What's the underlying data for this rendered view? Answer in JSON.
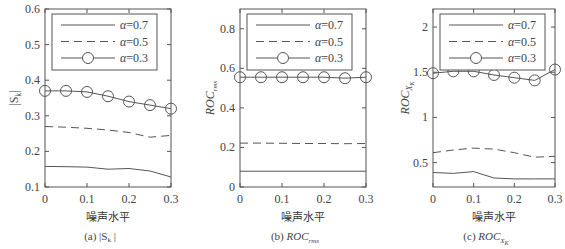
{
  "chart_data": [
    {
      "type": "line",
      "panel": "a",
      "caption": "(a) |S_k|",
      "caption_label": "(a)",
      "caption_symbol": "|S",
      "caption_sub": "k",
      "caption_end": "|",
      "xlabel": "噪声水平",
      "ylabel": "|S_k|",
      "x": [
        0,
        0.05,
        0.1,
        0.15,
        0.2,
        0.25,
        0.3
      ],
      "xticks": [
        "0",
        "0.1",
        "0.2",
        "0.3"
      ],
      "xlim": [
        0,
        0.3
      ],
      "ylim": [
        0.1,
        0.6
      ],
      "yticks": [
        "0.1",
        "0.2",
        "0.3",
        "0.4",
        "0.5",
        "0.6"
      ],
      "legend_position": "upper left",
      "series": [
        {
          "name": "α=0.7",
          "style": "solid",
          "values": [
            0.158,
            0.157,
            0.156,
            0.15,
            0.152,
            0.145,
            0.128
          ]
        },
        {
          "name": "α=0.5",
          "style": "dashed",
          "values": [
            0.27,
            0.268,
            0.265,
            0.26,
            0.253,
            0.24,
            0.245
          ]
        },
        {
          "name": "α=0.3",
          "style": "solid-circle",
          "values": [
            0.37,
            0.37,
            0.367,
            0.355,
            0.34,
            0.33,
            0.32
          ]
        }
      ]
    },
    {
      "type": "line",
      "panel": "b",
      "caption": "(b) ROC_rms",
      "caption_label": "(b)",
      "caption_symbol": "ROC",
      "caption_sub": "rms",
      "xlabel": "噪声水平",
      "ylabel": "ROC_rms",
      "x": [
        0,
        0.05,
        0.1,
        0.15,
        0.2,
        0.25,
        0.3
      ],
      "xticks": [
        "0",
        "0.1",
        "0.2",
        "0.3"
      ],
      "xlim": [
        0,
        0.3
      ],
      "ylim": [
        0,
        0.9
      ],
      "yticks": [
        "0",
        "0.2",
        "0.4",
        "0.6",
        "0.8"
      ],
      "legend_position": "upper left",
      "series": [
        {
          "name": "α=0.7",
          "style": "solid",
          "values": [
            0.08,
            0.08,
            0.08,
            0.08,
            0.08,
            0.08,
            0.08
          ]
        },
        {
          "name": "α=0.5",
          "style": "dashed",
          "values": [
            0.222,
            0.222,
            0.221,
            0.22,
            0.22,
            0.219,
            0.22
          ]
        },
        {
          "name": "α=0.3",
          "style": "solid-circle",
          "values": [
            0.555,
            0.555,
            0.555,
            0.555,
            0.555,
            0.55,
            0.555
          ]
        }
      ]
    },
    {
      "type": "line",
      "panel": "c",
      "caption": "(c) ROC_X_K",
      "caption_label": "(c)",
      "caption_symbol": "ROC",
      "caption_sub": "X",
      "caption_subsub": "K",
      "xlabel": "噪声水平",
      "ylabel": "ROC_X_K",
      "x": [
        0,
        0.05,
        0.1,
        0.15,
        0.2,
        0.25,
        0.3
      ],
      "xticks": [
        "0",
        "0.1",
        "0.2",
        "0.3"
      ],
      "xlim": [
        0,
        0.3
      ],
      "ylim": [
        0.23,
        2.2
      ],
      "yticks": [
        "0.5",
        "1",
        "1.5",
        "2"
      ],
      "legend_position": "upper left",
      "series": [
        {
          "name": "α=0.7",
          "style": "solid",
          "values": [
            0.39,
            0.38,
            0.4,
            0.33,
            0.32,
            0.32,
            0.32
          ]
        },
        {
          "name": "α=0.5",
          "style": "dashed",
          "values": [
            0.61,
            0.64,
            0.66,
            0.65,
            0.61,
            0.56,
            0.57
          ]
        },
        {
          "name": "α=0.3",
          "style": "solid-circle",
          "values": [
            1.49,
            1.51,
            1.51,
            1.47,
            1.44,
            1.41,
            1.53
          ]
        }
      ]
    }
  ],
  "panels": [
    {
      "left": 45,
      "right": 171,
      "top": 9,
      "bottom": 187,
      "ylabel_x": 14
    },
    {
      "left": 240,
      "right": 366,
      "top": 9,
      "bottom": 187,
      "ylabel_x": 210
    },
    {
      "left": 433,
      "right": 555,
      "top": 9,
      "bottom": 187,
      "ylabel_x": 405
    }
  ]
}
